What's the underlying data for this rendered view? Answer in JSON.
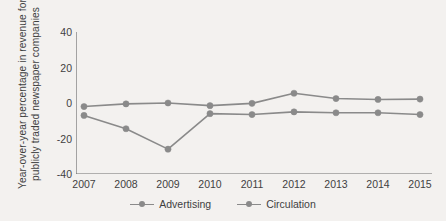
{
  "chart_data": {
    "type": "line",
    "title": "",
    "xlabel": "",
    "ylabel_line1": "Year-over-year  percentage in revenue for",
    "ylabel_line2": "publicly traded newspaper companies",
    "categories": [
      "2007",
      "2008",
      "2009",
      "2010",
      "2011",
      "2012",
      "2013",
      "2014",
      "2015"
    ],
    "ylim": [
      -40,
      40
    ],
    "yticks": [
      40,
      20,
      0,
      -20,
      -40
    ],
    "ytick_labels": [
      "40",
      "20",
      "0",
      "-20",
      "-40"
    ],
    "grid": false,
    "legend_position": "bottom-center",
    "series": [
      {
        "name": "Advertising",
        "color": "#8a8a8a",
        "values": [
          -7,
          -14.5,
          -26,
          -6,
          -6.5,
          -5,
          -5.5,
          -5.5,
          -6.5
        ]
      },
      {
        "name": "Circulation",
        "color": "#8a8a8a",
        "values": [
          -2,
          -0.5,
          0,
          -1.5,
          -0.2,
          5.5,
          2.5,
          2,
          2.2
        ]
      }
    ]
  },
  "legend": {
    "items": [
      {
        "label": "Advertising",
        "marker": "line-marker-icon"
      },
      {
        "label": "Circulation",
        "marker": "line-marker-icon"
      }
    ]
  },
  "colors": {
    "background": "#f3f1ef",
    "line": "#8a8a8a",
    "axis": "#6e6e6e",
    "text": "#3f3f3f"
  }
}
